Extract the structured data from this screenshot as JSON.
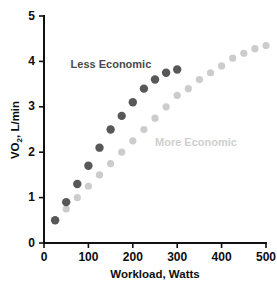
{
  "chart_data": {
    "type": "scatter",
    "title": "",
    "xlabel": "Workload, Watts",
    "ylabel": "VO2, L/min",
    "ylabel_main": "VO",
    "ylabel_sub": "2",
    "ylabel_rest": ", L/min",
    "xlim": [
      0,
      500
    ],
    "ylim": [
      0,
      5
    ],
    "xticks": [
      0,
      100,
      200,
      300,
      400,
      500
    ],
    "yticks": [
      0,
      1,
      2,
      3,
      4,
      5
    ],
    "xtick_labels": [
      "0",
      "100",
      "200",
      "300",
      "400",
      "500"
    ],
    "ytick_labels": [
      "0",
      "1",
      "2",
      "3",
      "4",
      "5"
    ],
    "grid": false,
    "legend_position": "inline-annotation",
    "series": [
      {
        "name": "Less Economic",
        "color": "#585858",
        "marker": "circle",
        "marker_size": 4.2,
        "label_x": 60,
        "label_y": 3.93,
        "x": [
          25,
          50,
          75,
          100,
          125,
          150,
          175,
          200,
          225,
          250,
          275,
          300
        ],
        "values": [
          0.5,
          0.9,
          1.3,
          1.7,
          2.1,
          2.5,
          2.8,
          3.1,
          3.4,
          3.6,
          3.75,
          3.82
        ]
      },
      {
        "name": "More Economic",
        "color": "#cccccc",
        "marker": "circle",
        "marker_size": 3.6,
        "label_x": 250,
        "label_y": 2.2,
        "x": [
          50,
          75,
          100,
          125,
          150,
          175,
          200,
          225,
          250,
          275,
          300,
          325,
          350,
          375,
          400,
          425,
          450,
          475,
          500
        ],
        "values": [
          0.75,
          1.0,
          1.25,
          1.5,
          1.75,
          2.0,
          2.25,
          2.5,
          2.75,
          3.0,
          3.25,
          3.4,
          3.6,
          3.75,
          3.9,
          4.07,
          4.18,
          4.28,
          4.35
        ]
      }
    ]
  },
  "annotations": {
    "less_economic_label": "Less Economic",
    "more_economic_label": "More Economic"
  },
  "axis": {
    "x_title": "Workload, Watts",
    "y_title_main": "VO",
    "y_title_sub": "2",
    "y_title_rest": ", L/min"
  },
  "colors": {
    "dark_series": "#585858",
    "light_series": "#cccccc",
    "axis": "#111111",
    "text": "#0d0d0d",
    "background": "#ffffff"
  }
}
